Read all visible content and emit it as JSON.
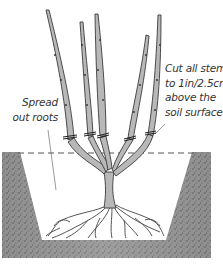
{
  "diagram": {
    "annotations": {
      "cut_stems": {
        "lines": [
          "Cut all stems",
          "to 1in/2.5cm",
          "above the",
          "soil surface"
        ]
      },
      "spread_roots": {
        "lines": [
          "Spread",
          "out roots"
        ]
      }
    },
    "elements": {
      "soil_level_line": "dashed",
      "stem_count": 5
    },
    "colors": {
      "soil": "#8a8a8a",
      "stem_fill": "#b5b5b5",
      "outline": "#3a3a3a",
      "text": "#333333",
      "background": "#ffffff"
    }
  }
}
